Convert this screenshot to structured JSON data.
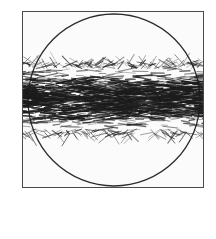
{
  "figure": {
    "name": "spun-staple-yarn-diagram",
    "caption_lines": [
      "spun staple",
      "yarn"
    ],
    "caption_full": "spun staple yarn",
    "frame": {
      "shape": "square",
      "x": 22,
      "y": 11,
      "width": 182,
      "height": 177,
      "border_color": "#4a4a4a",
      "fill_color": "#fbfbfb"
    },
    "magnifier_circle": {
      "shape": "circle",
      "center_x": 91,
      "center_y": 88,
      "radius": 86,
      "stroke_color": "#2b2b2b",
      "fill_color": "none"
    },
    "yarn_band": {
      "label": "spun staple yarn band",
      "description": "horizontal band of short irregular staple fibres with hairy protruding ends",
      "top": 52,
      "bottom": 122,
      "fiber_color": "#1c1c1c",
      "fiber_count": 1400,
      "hair_count": 210
    },
    "colors": {
      "page_background": "#ffffff",
      "ink": "#1c1c1c",
      "frame_line": "#4a4a4a",
      "caption_text": "#2e2e2e"
    }
  }
}
